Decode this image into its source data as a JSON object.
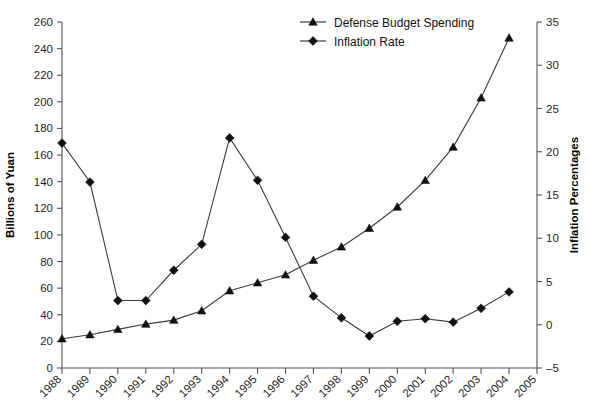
{
  "chart_data": {
    "type": "line",
    "title": "",
    "xlabel": "",
    "ylabel": "Billions of Yuan",
    "y2label": "Inflation Percentages",
    "grid": false,
    "legend_position": "top-center",
    "categories": [
      "1988",
      "1989",
      "1990",
      "1991",
      "1992",
      "1993",
      "1994",
      "1995",
      "1996",
      "1997",
      "1998",
      "1999",
      "2000",
      "2001",
      "2002",
      "2003",
      "2004",
      "2005"
    ],
    "xlim": [
      "1988",
      "2005"
    ],
    "ylim": [
      0,
      260
    ],
    "yticks": [
      0,
      20,
      40,
      60,
      80,
      100,
      120,
      140,
      160,
      180,
      200,
      220,
      240,
      260
    ],
    "y2lim": [
      -5,
      35
    ],
    "y2ticks": [
      -5,
      0,
      5,
      10,
      15,
      20,
      25,
      30,
      35
    ],
    "series": [
      {
        "name": "Defense Budget Spending",
        "axis": "left",
        "unit": "Billions of Yuan",
        "marker": "triangle",
        "x": [
          "1988",
          "1989",
          "1990",
          "1991",
          "1992",
          "1993",
          "1994",
          "1995",
          "1996",
          "1997",
          "1998",
          "1999",
          "2000",
          "2001",
          "2002",
          "2003",
          "2004"
        ],
        "values": [
          22,
          25,
          29,
          33,
          36,
          43,
          58,
          64,
          70,
          81,
          91,
          105,
          121,
          141,
          166,
          203,
          248
        ]
      },
      {
        "name": "Inflation Rate",
        "axis": "right",
        "unit": "Percent",
        "marker": "diamond",
        "x": [
          "1988",
          "1989",
          "1990",
          "1991",
          "1992",
          "1993",
          "1994",
          "1995",
          "1996",
          "1997",
          "1998",
          "1999",
          "2000",
          "2001",
          "2002",
          "2003",
          "2004"
        ],
        "values": [
          21.0,
          16.5,
          2.8,
          2.8,
          6.3,
          9.3,
          21.6,
          16.7,
          10.1,
          3.3,
          0.8,
          -1.3,
          0.4,
          0.7,
          0.3,
          1.9,
          3.8
        ]
      }
    ]
  },
  "legend": {
    "items": [
      {
        "label": "Defense Budget Spending",
        "marker": "triangle"
      },
      {
        "label": "Inflation Rate",
        "marker": "diamond"
      }
    ]
  },
  "axes": {
    "left_title": "Billions of Yuan",
    "right_title": "Inflation Percentages"
  },
  "colors": {
    "line": "#3b3b3b",
    "marker": "#111111",
    "axis": "#555555",
    "text": "#1a1a1a",
    "background": "#ffffff"
  }
}
